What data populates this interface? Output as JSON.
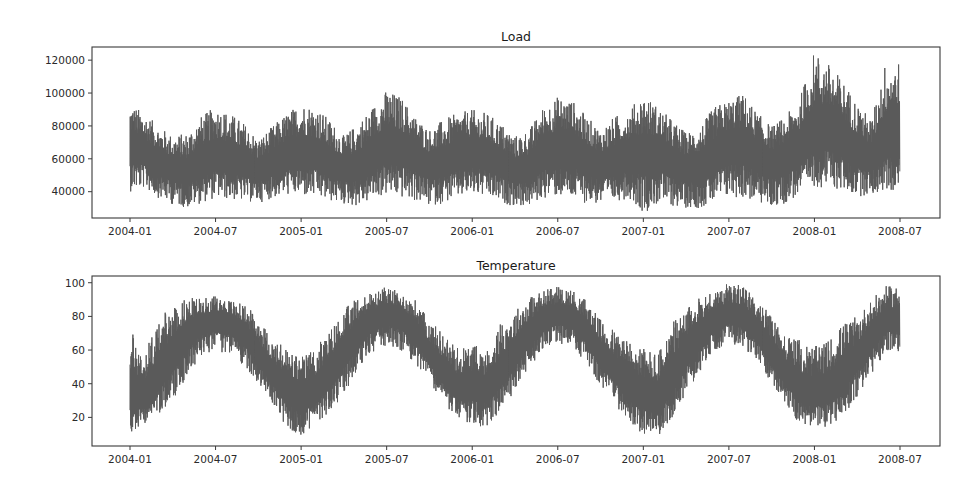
{
  "chart_data": [
    {
      "type": "line",
      "title": "Load",
      "xlabel": "",
      "ylabel": "",
      "x_range": [
        "2004-01",
        "2008-07"
      ],
      "x_ticks": [
        "2004-01",
        "2004-07",
        "2005-01",
        "2005-07",
        "2006-01",
        "2006-07",
        "2007-01",
        "2007-07",
        "2008-01",
        "2008-07"
      ],
      "y_ticks": [
        40000,
        60000,
        80000,
        100000,
        120000
      ],
      "y_tick_labels": [
        "40000",
        "60000",
        "80000",
        "100000",
        "120000"
      ],
      "ylim": [
        24000,
        128000
      ],
      "grid": false,
      "legend": null,
      "series": [
        {
          "name": "Load",
          "color": "#5a5a5a",
          "resolution": "hourly (approximated as monthly envelope)",
          "monthly": {
            "months": [
              "2004-01",
              "2004-02",
              "2004-03",
              "2004-04",
              "2004-05",
              "2004-06",
              "2004-07",
              "2004-08",
              "2004-09",
              "2004-10",
              "2004-11",
              "2004-12",
              "2005-01",
              "2005-02",
              "2005-03",
              "2005-04",
              "2005-05",
              "2005-06",
              "2005-07",
              "2005-08",
              "2005-09",
              "2005-10",
              "2005-11",
              "2005-12",
              "2006-01",
              "2006-02",
              "2006-03",
              "2006-04",
              "2006-05",
              "2006-06",
              "2006-07",
              "2006-08",
              "2006-09",
              "2006-10",
              "2006-11",
              "2006-12",
              "2007-01",
              "2007-02",
              "2007-03",
              "2007-04",
              "2007-05",
              "2007-06",
              "2007-07",
              "2007-08",
              "2007-09",
              "2007-10",
              "2007-11",
              "2007-12",
              "2008-01",
              "2008-02",
              "2008-03",
              "2008-04",
              "2008-05",
              "2008-06"
            ],
            "min": [
              40000,
              42000,
              36000,
              32000,
              30000,
              33000,
              36000,
              35000,
              34000,
              33000,
              36000,
              38000,
              37000,
              36000,
              34000,
              32000,
              31000,
              35000,
              38000,
              36000,
              34000,
              31000,
              33000,
              36000,
              38000,
              36000,
              33000,
              31000,
              31000,
              36000,
              37000,
              35000,
              33000,
              32000,
              34000,
              36000,
              27000,
              32000,
              31000,
              30000,
              30000,
              33000,
              36000,
              36000,
              33000,
              30000,
              33000,
              38000,
              43000,
              42000,
              40000,
              37000,
              38000,
              40000
            ],
            "mean": [
              68000,
              64000,
              58000,
              54000,
              52000,
              58000,
              62000,
              60000,
              57000,
              53000,
              57000,
              62000,
              64000,
              63000,
              57000,
              54000,
              55000,
              62000,
              68000,
              66000,
              62000,
              56000,
              58000,
              62000,
              64000,
              62000,
              57000,
              53000,
              54000,
              62000,
              67000,
              66000,
              60000,
              56000,
              58000,
              62000,
              62000,
              64000,
              58000,
              54000,
              56000,
              62000,
              68000,
              68000,
              62000,
              57000,
              60000,
              66000,
              76000,
              78000,
              72000,
              64000,
              60000,
              72000
            ],
            "max": [
              94000,
              88000,
              80000,
              74000,
              76000,
              86000,
              92000,
              88000,
              82000,
              72000,
              80000,
              88000,
              94000,
              92000,
              84000,
              74000,
              82000,
              92000,
              102000,
              98000,
              86000,
              78000,
              84000,
              88000,
              90000,
              88000,
              82000,
              74000,
              78000,
              92000,
              98000,
              96000,
              86000,
              78000,
              86000,
              90000,
              100000,
              92000,
              84000,
              76000,
              80000,
              92000,
              96000,
              100000,
              88000,
              80000,
              86000,
              98000,
              126000,
              118000,
              108000,
              94000,
              84000,
              120000
            ]
          }
        }
      ]
    },
    {
      "type": "line",
      "title": "Temperature",
      "xlabel": "",
      "ylabel": "",
      "x_range": [
        "2004-01",
        "2008-07"
      ],
      "x_ticks": [
        "2004-01",
        "2004-07",
        "2005-01",
        "2005-07",
        "2006-01",
        "2006-07",
        "2007-01",
        "2007-07",
        "2008-01",
        "2008-07"
      ],
      "y_ticks": [
        20,
        40,
        60,
        80,
        100
      ],
      "y_tick_labels": [
        "20",
        "40",
        "60",
        "80",
        "100"
      ],
      "ylim": [
        3,
        104
      ],
      "grid": false,
      "legend": null,
      "series": [
        {
          "name": "Temperature",
          "color": "#5a5a5a",
          "resolution": "hourly (approximated as monthly envelope)",
          "monthly": {
            "months": [
              "2004-01",
              "2004-02",
              "2004-03",
              "2004-04",
              "2004-05",
              "2004-06",
              "2004-07",
              "2004-08",
              "2004-09",
              "2004-10",
              "2004-11",
              "2004-12",
              "2005-01",
              "2005-02",
              "2005-03",
              "2005-04",
              "2005-05",
              "2005-06",
              "2005-07",
              "2005-08",
              "2005-09",
              "2005-10",
              "2005-11",
              "2005-12",
              "2006-01",
              "2006-02",
              "2006-03",
              "2006-04",
              "2006-05",
              "2006-06",
              "2006-07",
              "2006-08",
              "2006-09",
              "2006-10",
              "2006-11",
              "2006-12",
              "2007-01",
              "2007-02",
              "2007-03",
              "2007-04",
              "2007-05",
              "2007-06",
              "2007-07",
              "2007-08",
              "2007-09",
              "2007-10",
              "2007-11",
              "2007-12",
              "2008-01",
              "2008-02",
              "2008-03",
              "2008-04",
              "2008-05",
              "2008-06"
            ],
            "min": [
              7,
              16,
              22,
              30,
              45,
              57,
              58,
              58,
              50,
              38,
              28,
              13,
              9,
              16,
              22,
              34,
              48,
              58,
              62,
              60,
              52,
              40,
              28,
              18,
              15,
              14,
              24,
              36,
              50,
              60,
              63,
              62,
              52,
              38,
              28,
              16,
              10,
              8,
              20,
              34,
              48,
              60,
              64,
              62,
              52,
              40,
              26,
              16,
              12,
              15,
              20,
              32,
              46,
              58
            ],
            "mean": [
              35,
              32,
              44,
              58,
              70,
              76,
              78,
              77,
              70,
              58,
              46,
              36,
              30,
              35,
              46,
              58,
              70,
              78,
              82,
              80,
              72,
              58,
              46,
              36,
              38,
              36,
              46,
              58,
              70,
              78,
              82,
              80,
              72,
              58,
              48,
              38,
              34,
              30,
              44,
              58,
              70,
              78,
              82,
              80,
              72,
              58,
              46,
              36,
              34,
              36,
              46,
              56,
              68,
              78
            ],
            "max": [
              73,
              60,
              78,
              87,
              91,
              91,
              92,
              90,
              87,
              80,
              66,
              62,
              56,
              62,
              72,
              84,
              92,
              94,
              98,
              94,
              90,
              78,
              70,
              62,
              64,
              60,
              76,
              84,
              92,
              96,
              98,
              96,
              90,
              78,
              72,
              66,
              62,
              58,
              76,
              84,
              92,
              96,
              100,
              98,
              90,
              80,
              70,
              66,
              62,
              66,
              76,
              80,
              90,
              98
            ]
          }
        }
      ]
    }
  ]
}
